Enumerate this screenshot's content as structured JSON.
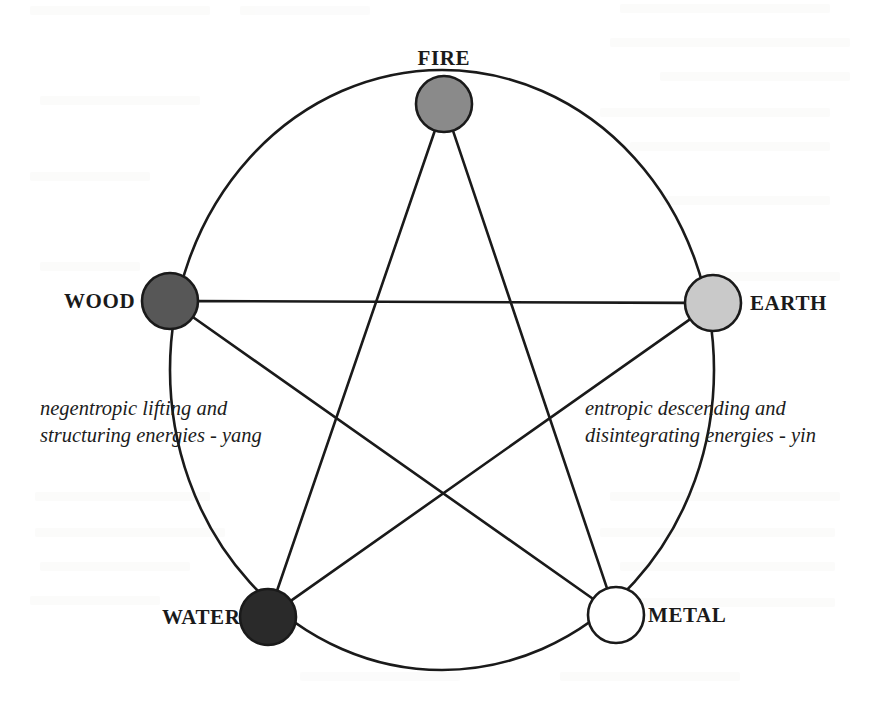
{
  "figure": {
    "background_color": "#ffffff",
    "stroke_color": "#1a1a1a",
    "outer_circle": {
      "name": "generating-cycle-circle",
      "center_x": 442,
      "center_y": 370,
      "radius_x": 272,
      "radius_y": 300,
      "stroke_width": 2.6
    }
  },
  "nodes": [
    {
      "id": "fire",
      "label": "FIRE",
      "fill": "#8a8a8a",
      "stroke": "#1a1a1a",
      "cx": 444,
      "cy": 104,
      "r": 28,
      "label_x": 444,
      "label_y": 58,
      "label_anchor": "middle"
    },
    {
      "id": "wood",
      "label": "WOOD",
      "fill": "#575757",
      "stroke": "#1a1a1a",
      "cx": 170,
      "cy": 301,
      "r": 28,
      "label_x": 135,
      "label_y": 301,
      "label_anchor": "end"
    },
    {
      "id": "earth",
      "label": "EARTH",
      "fill": "#c9c9c9",
      "stroke": "#1a1a1a",
      "cx": 713,
      "cy": 303,
      "r": 28,
      "label_x": 750,
      "label_y": 303,
      "label_anchor": "start"
    },
    {
      "id": "water",
      "label": "WATER",
      "fill": "#2a2a2a",
      "stroke": "#1a1a1a",
      "cx": 268,
      "cy": 617,
      "r": 28,
      "label_x": 240,
      "label_y": 617,
      "label_anchor": "end"
    },
    {
      "id": "metal",
      "label": "METAL",
      "fill": "#ffffff",
      "stroke": "#1a1a1a",
      "cx": 616,
      "cy": 615,
      "r": 28,
      "label_x": 648,
      "label_y": 615,
      "label_anchor": "start"
    }
  ],
  "edges": [
    {
      "id": "fire-metal",
      "from": "fire",
      "to": "metal"
    },
    {
      "id": "metal-wood",
      "from": "metal",
      "to": "wood"
    },
    {
      "id": "wood-earth",
      "from": "wood",
      "to": "earth"
    },
    {
      "id": "earth-water",
      "from": "earth",
      "to": "water"
    },
    {
      "id": "water-fire",
      "from": "water",
      "to": "fire"
    }
  ],
  "annotations": [
    {
      "id": "yang-annotation",
      "line1": "negentropic lifting and",
      "line2": "structuring energies - yang",
      "x": 40,
      "y": 395
    },
    {
      "id": "yin-annotation",
      "line1": "entropic descending and",
      "line2": "disintegrating energies - yin",
      "x": 585,
      "y": 395
    }
  ]
}
